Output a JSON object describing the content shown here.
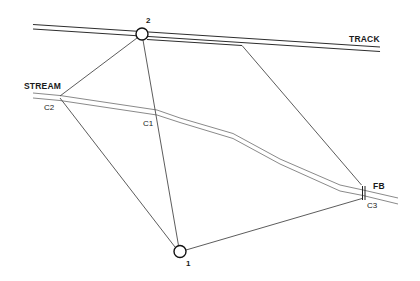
{
  "diagram": {
    "labels": {
      "track": "TRACK",
      "stream": "STREAM",
      "footbridge": "FB",
      "c1": "C1",
      "c2": "C2",
      "c3": "C3",
      "station_1": "1",
      "station_2": "2"
    },
    "features": [
      {
        "id": "track",
        "type": "double-line",
        "label": "TRACK"
      },
      {
        "id": "stream",
        "type": "double-line-curve",
        "label": "STREAM"
      },
      {
        "id": "footbridge",
        "type": "crossing-marker",
        "label": "FB"
      }
    ],
    "stations": [
      {
        "id": "1",
        "label": "1"
      },
      {
        "id": "2",
        "label": "2"
      }
    ],
    "control_points": [
      {
        "id": "C1",
        "label": "C1"
      },
      {
        "id": "C2",
        "label": "C2"
      },
      {
        "id": "C3",
        "label": "C3"
      }
    ],
    "connections": [
      [
        "2",
        "C2"
      ],
      [
        "2",
        "1"
      ],
      [
        "2",
        "FB"
      ],
      [
        "C2",
        "1"
      ],
      [
        "1",
        "C3"
      ]
    ],
    "colors": {
      "background": "#ffffff",
      "track": "#2e2e2e",
      "stream": "#8a8a8a",
      "survey_lines": "#4a4a4a",
      "text": "#1a1a1a"
    }
  }
}
